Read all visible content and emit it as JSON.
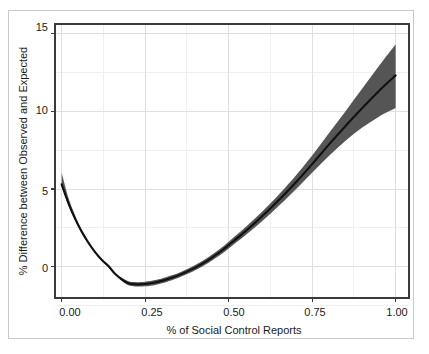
{
  "chart_data": {
    "type": "line",
    "title": "",
    "subtitle": "",
    "xlabel": "% of Social Control Reports",
    "ylabel": "% Difference between Observed and Expected",
    "xlim": [
      -0.02,
      1.04
    ],
    "ylim": [
      -2.0,
      15.6
    ],
    "xticks": [
      0.0,
      0.25,
      0.5,
      0.75,
      1.0
    ],
    "xtick_labels": [
      "0.00",
      "0.25",
      "0.50",
      "0.75",
      "1.00"
    ],
    "yticks": [
      0,
      5,
      10,
      15
    ],
    "ytick_labels": [
      "0",
      "5",
      "10",
      "15"
    ],
    "grid": true,
    "minor_grid": true,
    "legend": false,
    "legend_position": "none",
    "line_color": "#111111",
    "band_color": "#555555",
    "grid_color": "#e3e3e3",
    "frame_color": "#3a3a3a",
    "x": [
      0.0,
      0.02,
      0.04,
      0.06,
      0.08,
      0.1,
      0.12,
      0.14,
      0.16,
      0.18,
      0.2,
      0.22,
      0.25,
      0.28,
      0.3,
      0.33,
      0.36,
      0.4,
      0.44,
      0.48,
      0.5,
      0.54,
      0.58,
      0.62,
      0.66,
      0.7,
      0.75,
      0.8,
      0.85,
      0.9,
      0.95,
      1.0
    ],
    "series": [
      {
        "name": "fitted",
        "values": [
          5.3,
          4.1,
          3.1,
          2.25,
          1.55,
          0.95,
          0.45,
          0.05,
          -0.45,
          -0.8,
          -1.05,
          -1.12,
          -1.1,
          -1.0,
          -0.9,
          -0.7,
          -0.45,
          -0.05,
          0.45,
          1.05,
          1.4,
          2.1,
          2.85,
          3.65,
          4.5,
          5.4,
          6.6,
          7.85,
          9.05,
          10.2,
          11.3,
          12.3
        ]
      },
      {
        "name": "ci_lower",
        "values": [
          5.15,
          3.98,
          2.99,
          2.16,
          1.47,
          0.88,
          0.38,
          -0.02,
          -0.53,
          -0.9,
          -1.18,
          -1.26,
          -1.25,
          -1.16,
          -1.06,
          -0.86,
          -0.61,
          -0.22,
          0.26,
          0.84,
          1.18,
          1.85,
          2.56,
          3.32,
          4.12,
          4.96,
          6.05,
          7.12,
          8.1,
          8.95,
          9.65,
          10.2
        ]
      },
      {
        "name": "ci_upper",
        "values": [
          6.05,
          4.45,
          3.32,
          2.4,
          1.66,
          1.04,
          0.53,
          0.13,
          -0.36,
          -0.7,
          -0.92,
          -0.98,
          -0.95,
          -0.84,
          -0.74,
          -0.54,
          -0.29,
          0.12,
          0.64,
          1.26,
          1.62,
          2.35,
          3.14,
          3.98,
          4.88,
          5.84,
          7.15,
          8.58,
          10.0,
          11.45,
          12.9,
          14.3
        ]
      }
    ],
    "annotations": {
      "curve_start_value": 5.3,
      "curve_minimum_value": -1.12,
      "curve_minimum_x": 0.22,
      "curve_end_value": 12.3,
      "band_end_lower": 10.2,
      "band_end_upper": 14.3
    }
  },
  "axes": {
    "x_title": "% of Social Control Reports",
    "y_title": "% Difference between Observed and Expected"
  }
}
